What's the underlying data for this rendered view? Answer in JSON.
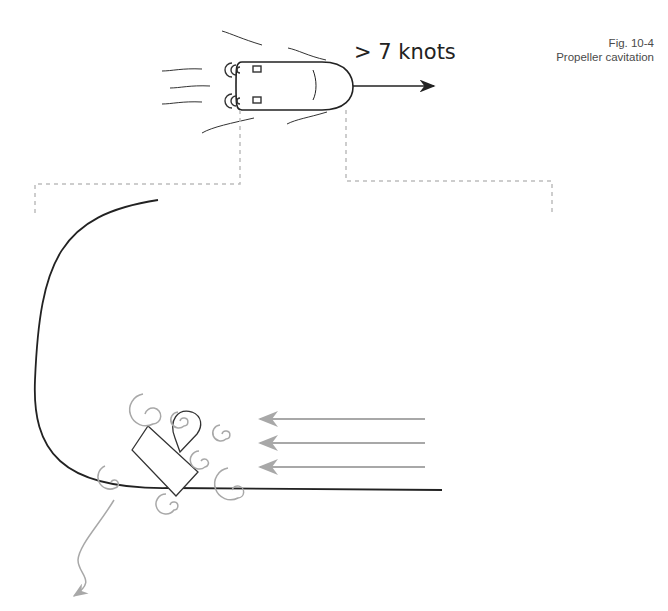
{
  "figure": {
    "number": "Fig. 10-4",
    "title": "Propeller cavitation"
  },
  "boat_top": {
    "speed_label": "> 7 knots"
  },
  "colors": {
    "line": "#222222",
    "swirl": "#a8a8a8",
    "dashed": "#bdbdbd",
    "flow_arrows": "#a8a8a8"
  }
}
